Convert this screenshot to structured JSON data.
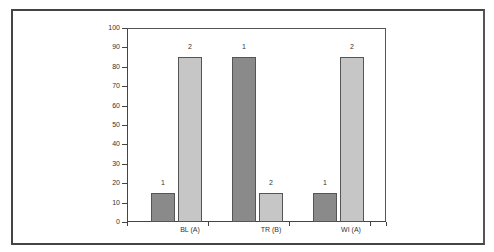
{
  "chart_data": {
    "type": "bar",
    "title": "",
    "xlabel": "",
    "ylabel": "",
    "ylim": [
      0,
      100
    ],
    "yticks": [
      0,
      10,
      20,
      30,
      40,
      50,
      60,
      70,
      80,
      90,
      100
    ],
    "categories": [
      "BL (A)",
      "TR (B)",
      "WI (A)"
    ],
    "series": [
      {
        "name": "1",
        "color": "#8a8a8a",
        "values": [
          15,
          85,
          15
        ]
      },
      {
        "name": "2",
        "color": "#c6c6c6",
        "values": [
          85,
          15,
          85
        ]
      }
    ],
    "data_labels": true,
    "grid": false,
    "legend": "none"
  },
  "axis": {
    "y_labels": [
      "0",
      "10",
      "20",
      "30",
      "40",
      "50",
      "60",
      "70",
      "80",
      "90",
      "100"
    ]
  },
  "labels": {
    "categories": [
      "BL (A)",
      "TR (B)",
      "WI (A)"
    ],
    "bar_labels": [
      "1",
      "2",
      "1",
      "2",
      "1",
      "2"
    ]
  }
}
